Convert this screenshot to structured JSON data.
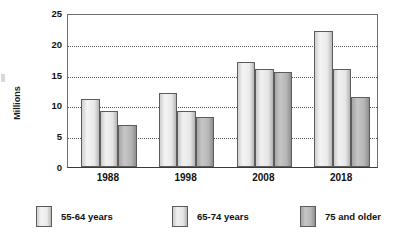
{
  "chart_data": {
    "type": "bar",
    "title": "",
    "xlabel": "",
    "ylabel": "Millions",
    "categories": [
      "1988",
      "1998",
      "2008",
      "2018"
    ],
    "series": [
      {
        "name": "55-64 years",
        "values": [
          11.0,
          12.0,
          17.1,
          22.0
        ],
        "color": "#eaeaea"
      },
      {
        "name": "65-74 years",
        "values": [
          9.1,
          9.1,
          15.9,
          15.9
        ],
        "color": "#e6e6e6"
      },
      {
        "name": "75 and older",
        "values": [
          6.9,
          8.1,
          15.5,
          11.4
        ],
        "color": "#b5b5b5"
      }
    ],
    "ylim": [
      0,
      25
    ],
    "yticks": [
      0,
      5,
      10,
      15,
      20,
      25
    ],
    "ytick_labels": [
      "0",
      "5",
      "10",
      "15",
      "20",
      "25"
    ],
    "grid": true,
    "grid_axis": "y",
    "legend_position": "bottom"
  },
  "axis": {
    "y_title": "Millions"
  }
}
